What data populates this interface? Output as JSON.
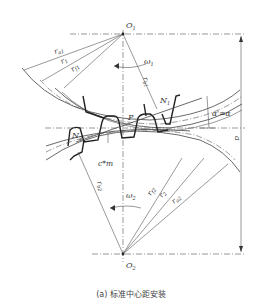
{
  "diagram": {
    "title": "标准中心距安装",
    "caption_prefix": "(a)",
    "caption": "(a) 标准中心距安装",
    "points": {
      "O1": {
        "label": "O",
        "sub": "1"
      },
      "O2": {
        "label": "O",
        "sub": "2"
      },
      "P": {
        "label": "P"
      },
      "N1": {
        "label": "N",
        "sub": "1"
      },
      "N2": {
        "label": "N",
        "sub": "2"
      }
    },
    "gear1_radii": [
      {
        "label": "r",
        "sub": "a1"
      },
      {
        "label": "r",
        "sub": "1"
      },
      {
        "label": "r",
        "sub": "f1"
      },
      {
        "label": "r",
        "sub": "b1"
      }
    ],
    "gear2_radii": [
      {
        "label": "r",
        "sub": "b2"
      },
      {
        "label": "r",
        "sub": "f2"
      },
      {
        "label": "r",
        "sub": "2"
      },
      {
        "label": "r",
        "sub": "a2"
      }
    ],
    "angular_velocity_1": {
      "label": "ω",
      "sub": "1"
    },
    "angular_velocity_2": {
      "label": "ω",
      "sub": "2"
    },
    "pressure_angle": "α'=α",
    "center_distance": "a",
    "clearance": "c*m"
  }
}
